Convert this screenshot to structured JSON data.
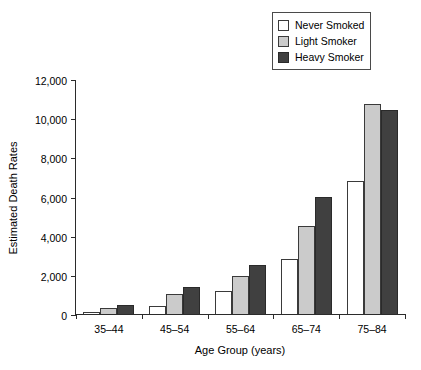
{
  "legend": {
    "position": "top-right",
    "entries": [
      {
        "label": "Never Smoked",
        "swatch": "#ffffff",
        "key": "never"
      },
      {
        "label": "Light Smoker",
        "swatch": "#cbcbcb",
        "key": "light"
      },
      {
        "label": "Heavy Smoker",
        "swatch": "#404040",
        "key": "heavy"
      }
    ]
  },
  "axes": {
    "y_title": "Estimated Death Rates",
    "x_title": "Age Group (years)",
    "y_ticks": [
      "0",
      "2,000",
      "4,000",
      "6,000",
      "8,000",
      "10,000",
      "12,000"
    ]
  },
  "chart_data": {
    "type": "bar",
    "title": "",
    "subtitle": "",
    "xlabel": "Age Group (years)",
    "ylabel": "Estimated Death Rates",
    "categories": [
      "35–44",
      "45–54",
      "55–64",
      "65–74",
      "75–84"
    ],
    "series": [
      {
        "name": "Never Smoked",
        "color": "#ffffff",
        "values": [
          100,
          400,
          1200,
          2800,
          6800
        ]
      },
      {
        "name": "Light Smoker",
        "color": "#cbcbcb",
        "values": [
          300,
          1000,
          1950,
          4500,
          10700
        ]
      },
      {
        "name": "Heavy Smoker",
        "color": "#404040",
        "values": [
          480,
          1400,
          2500,
          6000,
          10400
        ]
      }
    ],
    "ylim": [
      0,
      12000
    ],
    "ytick_step": 2000,
    "grid": false,
    "legend_position": "top-right"
  }
}
